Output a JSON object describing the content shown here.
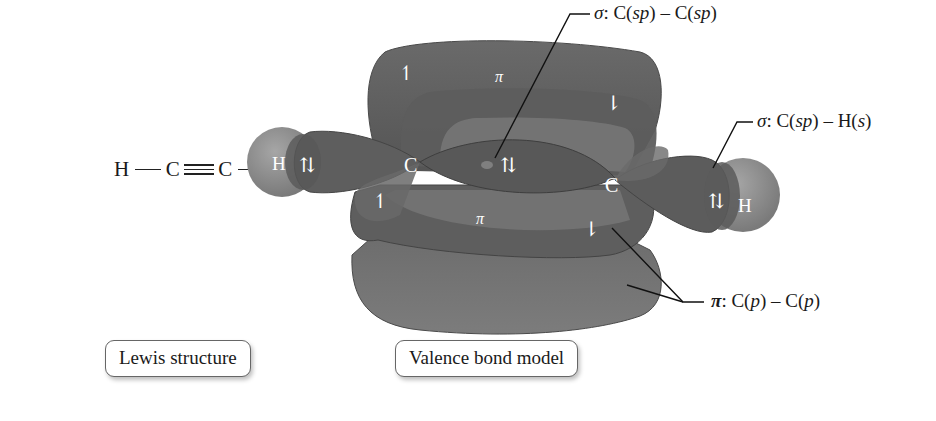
{
  "lewis_structure": {
    "atoms": [
      "H",
      "C",
      "C",
      "H"
    ],
    "bonds": [
      "single",
      "triple",
      "single"
    ],
    "caption": "Lewis structure"
  },
  "valence_bond_model": {
    "caption": "Valence bond model",
    "atom_labels": {
      "left_h": "H",
      "left_c": "C",
      "right_c": "C",
      "right_h": "H"
    },
    "orbital_labels": {
      "pi_top": "π",
      "pi_bottom": "π"
    },
    "electron_marks": {
      "left_ch_pair": "⇅",
      "cc_sigma_pair": "⇅",
      "right_ch_pair": "⇅",
      "pi_top_left": "↿",
      "pi_top_right": "⇂",
      "pi_bottom_left": "↿",
      "pi_bottom_right": "⇂"
    },
    "callouts": {
      "sigma_cc": {
        "symbol": "σ",
        "text_a": ": C(",
        "hyb_a": "sp",
        "text_b": ") – C(",
        "hyb_b": "sp",
        "text_c": ")"
      },
      "sigma_ch": {
        "symbol": "σ",
        "text_a": ": C(",
        "hyb_a": "sp",
        "text_b": ") – H(",
        "hyb_b": "s",
        "text_c": ")"
      },
      "pi_cc": {
        "symbol": "π",
        "text_a": ": C(",
        "hyb_a": "p",
        "text_b": ") – C(",
        "hyb_b": "p",
        "text_c": ")"
      }
    },
    "colors": {
      "lobe_dark": "#5a5a5a",
      "lobe_mid": "#6e6e6e",
      "lobe_light": "#8a8a8a",
      "h_sphere": "#8c8c8c",
      "line": "#111111"
    }
  }
}
